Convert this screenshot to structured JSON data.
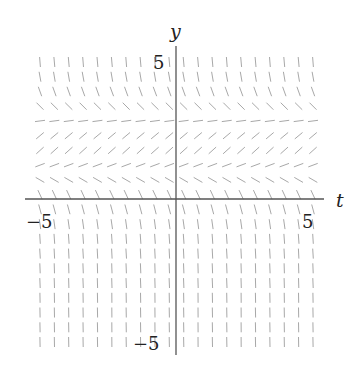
{
  "chart_data": {
    "type": "slope_field",
    "title": "",
    "xlabel": "t",
    "ylabel": "y",
    "xlim": [
      -5,
      5
    ],
    "ylim": [
      -5,
      5
    ],
    "x_ticks": [
      -5,
      5
    ],
    "y_ticks": [
      5,
      -5
    ],
    "x_tick_labels": [
      "−5",
      "5"
    ],
    "y_tick_labels": [
      "5",
      "−5"
    ],
    "grid": false,
    "legend": null,
    "field_grid": {
      "columns": 20,
      "rows": 20
    },
    "row_slope_angles_deg": [
      -85,
      -80,
      -70,
      -45,
      8,
      40,
      42,
      20,
      -30,
      -65,
      -75,
      -82,
      -86,
      -87,
      -88,
      -88,
      -89,
      -89,
      -89,
      -89
    ]
  },
  "colors": {
    "axis": "#555555",
    "segment": "#a8a8a8",
    "text": "#222222"
  }
}
